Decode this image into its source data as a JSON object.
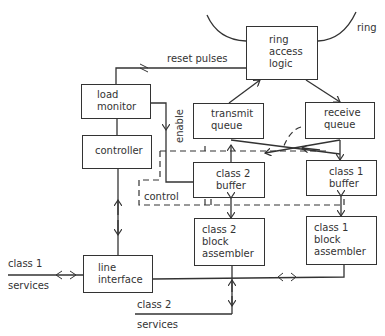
{
  "diagram": {
    "type": "block-diagram",
    "blocks": {
      "ring_access_logic": "ring\naccess\nlogic",
      "load_monitor": "load\nmonitor",
      "controller": "controller",
      "transmit_queue": "transmit\nqueue",
      "receive_queue": "receive\nqueue",
      "class2_buffer": "class 2\nbuffer",
      "class1_buffer": "class 1\nbuffer",
      "class2_block_assembler": "class 2\nblock\nassembler",
      "class1_block_assembler": "class 1\nblock\nassembler",
      "line_interface": "line\ninterface"
    },
    "labels": {
      "ring": "ring",
      "reset_pulses": "reset pulses",
      "enable": "enable",
      "control": "control",
      "class1": "class 1",
      "class1_services": "services",
      "class2": "class 2",
      "class2_services": "services"
    },
    "colors": {
      "line": "#333333",
      "background": "#ffffff"
    }
  }
}
